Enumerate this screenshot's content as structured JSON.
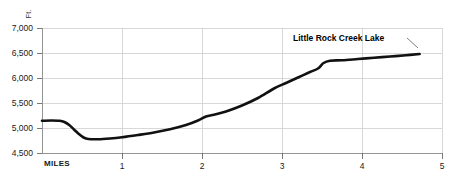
{
  "chart_data": {
    "type": "line",
    "title": "",
    "subtitle": "",
    "xlabel": "MILES",
    "ylabel": "Ft.",
    "xlim": [
      0,
      5
    ],
    "ylim": [
      4500,
      7000
    ],
    "grid": true,
    "legend": null,
    "x_ticks": [
      "1",
      "2",
      "3",
      "4",
      "5"
    ],
    "x_tick_values": [
      1,
      2,
      3,
      4,
      5
    ],
    "y_ticks": [
      "7,000",
      "6,500",
      "6,000",
      "5,500",
      "5,000",
      "4,500"
    ],
    "y_tick_values": [
      7000,
      6500,
      6000,
      5500,
      5000,
      4500
    ],
    "series": [
      {
        "name": "elevation-profile",
        "color": "#111111",
        "x": [
          0.0,
          0.12,
          0.22,
          0.28,
          0.34,
          0.4,
          0.46,
          0.52,
          0.58,
          0.7,
          0.85,
          1.0,
          1.2,
          1.4,
          1.6,
          1.8,
          1.95,
          2.05,
          2.15,
          2.3,
          2.5,
          2.7,
          2.9,
          3.05,
          3.2,
          3.35,
          3.45,
          3.52,
          3.6,
          3.75,
          3.95,
          4.15,
          4.35,
          4.55,
          4.72
        ],
        "y": [
          5145,
          5150,
          5145,
          5120,
          5060,
          4970,
          4880,
          4810,
          4780,
          4775,
          4790,
          4815,
          4860,
          4910,
          4975,
          5060,
          5150,
          5230,
          5265,
          5330,
          5450,
          5600,
          5790,
          5900,
          6010,
          6120,
          6190,
          6300,
          6345,
          6355,
          6380,
          6405,
          6430,
          6455,
          6480
        ]
      }
    ],
    "annotations": [
      {
        "name": "little-rock-creek-lake",
        "text": "Little Rock Creek Lake",
        "text_x": 293,
        "text_y": 41,
        "leader": [
          [
            407,
            38
          ],
          [
            418,
            48
          ]
        ]
      }
    ]
  },
  "axis_labels": {
    "y_unit": "Ft.",
    "x_name": "MILES"
  }
}
